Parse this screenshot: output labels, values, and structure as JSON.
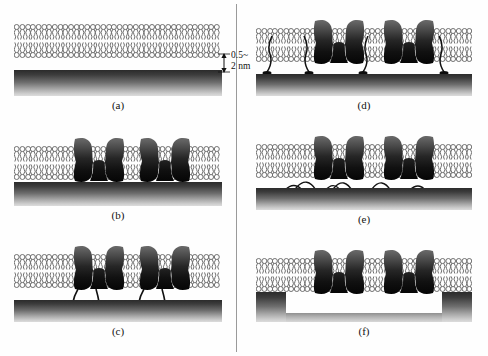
{
  "figure": {
    "panels": [
      {
        "id": "a",
        "caption": "(a)",
        "description": "solid-supported lipid bilayer on substrate",
        "has_proteins": false,
        "has_tethers": false,
        "has_cushion": false,
        "has_trench": false
      },
      {
        "id": "b",
        "caption": "(b)",
        "description": "supported bilayer with integral membrane proteins contacting substrate",
        "has_proteins": true,
        "has_tethers": false,
        "has_cushion": false,
        "has_trench": false
      },
      {
        "id": "c",
        "caption": "(c)",
        "description": "bilayer with proteins tethered to substrate by linkers",
        "has_proteins": true,
        "has_tethers": true,
        "has_cushion": false,
        "has_trench": false
      },
      {
        "id": "d",
        "caption": "(d)",
        "description": "polymer-tethered bilayer with lipid anchors on substrate",
        "has_proteins": true,
        "has_tethers": true,
        "has_cushion": false,
        "has_trench": false
      },
      {
        "id": "e",
        "caption": "(e)",
        "description": "polymer-cushioned bilayer on substrate",
        "has_proteins": true,
        "has_tethers": false,
        "has_cushion": true,
        "has_trench": false
      },
      {
        "id": "f",
        "caption": "(f)",
        "description": "membrane suspended across a substrate trench or pore",
        "has_proteins": true,
        "has_tethers": false,
        "has_cushion": false,
        "has_trench": true
      }
    ],
    "annotation": {
      "line1": "0.5~",
      "line2": "2 nm"
    },
    "colors": {
      "substrate_dark": "#2b2b2b",
      "substrate_light": "#dcdcdc",
      "protein_dark": "#141414",
      "protein_mid": "#5a5a5a",
      "lipid_stroke": "#6f6f6f",
      "divider": "#9a9a9a",
      "background": "#ffffff"
    }
  }
}
